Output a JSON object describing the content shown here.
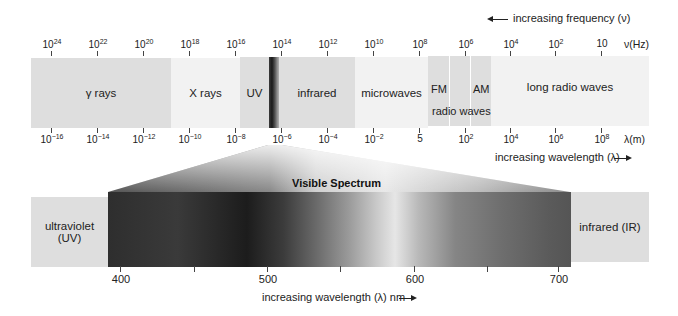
{
  "frequency_axis": {
    "direction_label": "increasing frequency (ν)",
    "unit_label": "ν(Hz)",
    "ticks": [
      {
        "base": "10",
        "exp": "24",
        "x": 51
      },
      {
        "base": "10",
        "exp": "22",
        "x": 97
      },
      {
        "base": "10",
        "exp": "20",
        "x": 143
      },
      {
        "base": "10",
        "exp": "18",
        "x": 189
      },
      {
        "base": "10",
        "exp": "16",
        "x": 235
      },
      {
        "base": "10",
        "exp": "14",
        "x": 281
      },
      {
        "base": "10",
        "exp": "12",
        "x": 327
      },
      {
        "base": "10",
        "exp": "10",
        "x": 373
      },
      {
        "base": "10",
        "exp": "8",
        "x": 419
      },
      {
        "base": "10",
        "exp": "6",
        "x": 465
      },
      {
        "base": "10",
        "exp": "4",
        "x": 510
      },
      {
        "base": "10",
        "exp": "2",
        "x": 555
      },
      {
        "base": "10",
        "exp": "",
        "x": 601
      }
    ]
  },
  "wavelength_axis": {
    "direction_label": "increasing wavelength (λ)",
    "unit_label": "λ(m)",
    "ticks": [
      {
        "base": "10",
        "exp": "−16",
        "x": 51
      },
      {
        "base": "10",
        "exp": "−14",
        "x": 97
      },
      {
        "base": "10",
        "exp": "−12",
        "x": 143
      },
      {
        "base": "10",
        "exp": "−10",
        "x": 189
      },
      {
        "base": "10",
        "exp": "−8",
        "x": 235
      },
      {
        "base": "10",
        "exp": "−6",
        "x": 281
      },
      {
        "base": "10",
        "exp": "−4",
        "x": 327
      },
      {
        "base": "10",
        "exp": "−2",
        "x": 373
      },
      {
        "base": "",
        "exp": "",
        "plain": "5",
        "x": 419
      },
      {
        "base": "10",
        "exp": "2",
        "x": 465
      },
      {
        "base": "10",
        "exp": "4",
        "x": 510
      },
      {
        "base": "10",
        "exp": "6",
        "x": 555
      },
      {
        "base": "10",
        "exp": "8",
        "x": 601
      }
    ]
  },
  "bands": {
    "gamma": "γ rays",
    "xray": "X rays",
    "uv": "UV",
    "infrared": "infrared",
    "microwaves": "microwaves",
    "fm": "FM",
    "am": "AM",
    "radio": "radio waves",
    "long_radio": "long radio waves"
  },
  "visible": {
    "title": "Visible Spectrum",
    "left_label_line1": "ultraviolet",
    "left_label_line2": "(UV)",
    "right_label": "infrared (IR)",
    "axis_label": "increasing wavelength (λ) nm",
    "ticks": [
      {
        "label": "400",
        "x": 120
      },
      {
        "label": "",
        "x": 194
      },
      {
        "label": "500",
        "x": 267
      },
      {
        "label": "",
        "x": 340
      },
      {
        "label": "600",
        "x": 414
      },
      {
        "label": "",
        "x": 487
      },
      {
        "label": "700",
        "x": 558
      }
    ]
  },
  "colors": {
    "band_fill": "#dedede",
    "band_light": "#f2f2f2"
  }
}
